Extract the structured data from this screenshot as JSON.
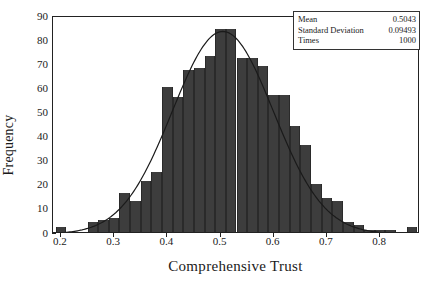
{
  "chart_data": {
    "type": "bar",
    "title": "",
    "subtitle": "",
    "xlabel": "Comprehensive Trust",
    "ylabel": "Frequency",
    "xlim": [
      0.185,
      0.875
    ],
    "ylim": [
      0,
      90
    ],
    "grid": false,
    "legend_position": "top-right",
    "bar_color": "#3d3d3d",
    "curve_color": "#1a1a1a",
    "xticks": [
      0.2,
      0.3,
      0.4,
      0.5,
      0.6,
      0.7,
      0.8
    ],
    "xtick_labels": [
      "0.2",
      "0.3",
      "0.4",
      "0.5",
      "0.6",
      "0.7",
      "0.8"
    ],
    "yticks": [
      0,
      10,
      20,
      30,
      40,
      50,
      60,
      70,
      80,
      90
    ],
    "ytick_labels": [
      "0",
      "10",
      "20",
      "30",
      "40",
      "50",
      "60",
      "70",
      "80",
      "90"
    ],
    "bin_width": 0.02,
    "bins": [
      {
        "x0": 0.19,
        "x1": 0.21,
        "value": 2
      },
      {
        "x0": 0.21,
        "x1": 0.23,
        "value": 0
      },
      {
        "x0": 0.23,
        "x1": 0.25,
        "value": 0
      },
      {
        "x0": 0.25,
        "x1": 0.27,
        "value": 4
      },
      {
        "x0": 0.27,
        "x1": 0.29,
        "value": 5
      },
      {
        "x0": 0.29,
        "x1": 0.31,
        "value": 6
      },
      {
        "x0": 0.31,
        "x1": 0.33,
        "value": 16
      },
      {
        "x0": 0.33,
        "x1": 0.35,
        "value": 13
      },
      {
        "x0": 0.35,
        "x1": 0.37,
        "value": 21
      },
      {
        "x0": 0.37,
        "x1": 0.39,
        "value": 25
      },
      {
        "x0": 0.39,
        "x1": 0.41,
        "value": 60
      },
      {
        "x0": 0.41,
        "x1": 0.43,
        "value": 56
      },
      {
        "x0": 0.43,
        "x1": 0.45,
        "value": 67
      },
      {
        "x0": 0.45,
        "x1": 0.47,
        "value": 68
      },
      {
        "x0": 0.47,
        "x1": 0.49,
        "value": 73
      },
      {
        "x0": 0.49,
        "x1": 0.51,
        "value": 84
      },
      {
        "x0": 0.51,
        "x1": 0.53,
        "value": 84
      },
      {
        "x0": 0.53,
        "x1": 0.55,
        "value": 72
      },
      {
        "x0": 0.55,
        "x1": 0.57,
        "value": 72
      },
      {
        "x0": 0.57,
        "x1": 0.59,
        "value": 69
      },
      {
        "x0": 0.59,
        "x1": 0.61,
        "value": 57
      },
      {
        "x0": 0.61,
        "x1": 0.63,
        "value": 57
      },
      {
        "x0": 0.63,
        "x1": 0.65,
        "value": 44
      },
      {
        "x0": 0.65,
        "x1": 0.67,
        "value": 36
      },
      {
        "x0": 0.67,
        "x1": 0.69,
        "value": 20
      },
      {
        "x0": 0.69,
        "x1": 0.71,
        "value": 14
      },
      {
        "x0": 0.71,
        "x1": 0.73,
        "value": 13
      },
      {
        "x0": 0.73,
        "x1": 0.75,
        "value": 4
      },
      {
        "x0": 0.75,
        "x1": 0.77,
        "value": 3
      },
      {
        "x0": 0.77,
        "x1": 0.79,
        "value": 1
      },
      {
        "x0": 0.79,
        "x1": 0.81,
        "value": 1
      },
      {
        "x0": 0.81,
        "x1": 0.83,
        "value": 1
      },
      {
        "x0": 0.83,
        "x1": 0.85,
        "value": 0
      },
      {
        "x0": 0.85,
        "x1": 0.87,
        "value": 2
      }
    ],
    "overlay_curve": {
      "name": "normal-density",
      "distribution": "normal",
      "mean": 0.5043,
      "std": 0.09493,
      "n": 1000,
      "peak_value": 84
    }
  },
  "legend": {
    "rows": [
      {
        "key": "Mean",
        "value": "0.5043"
      },
      {
        "key": "Standard Deviation",
        "value": "0.09493"
      },
      {
        "key": "Times",
        "value": "1000"
      }
    ]
  }
}
